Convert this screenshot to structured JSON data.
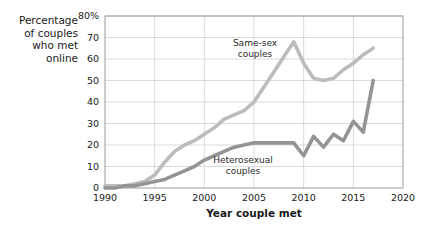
{
  "chart_data": {
    "type": "line",
    "title": "",
    "xlabel": "Year couple met",
    "ylabel": "Percentage of couples who met online",
    "ylabel_lines": [
      "Percentage",
      "of couples",
      "who met",
      "online"
    ],
    "xlim": [
      1990,
      2020
    ],
    "ylim": [
      0,
      80
    ],
    "grid": true,
    "legend_position": "inline-annotations",
    "x_ticks": [
      "1990",
      "1995",
      "2000",
      "2005",
      "2010",
      "2015",
      "2020"
    ],
    "x_tick_values": [
      1990,
      1995,
      2000,
      2005,
      2010,
      2015,
      2020
    ],
    "y_ticks": [
      "0",
      "10",
      "20",
      "30",
      "40",
      "50",
      "60",
      "70",
      "80%"
    ],
    "y_tick_values": [
      0,
      10,
      20,
      30,
      40,
      50,
      60,
      70,
      80
    ],
    "series": [
      {
        "name": "Same-sex couples",
        "color": "#bcbcbc",
        "label_lines": [
          "Same-sex",
          "couples"
        ],
        "x": [
          1990,
          1991,
          1992,
          1993,
          1994,
          1995,
          1996,
          1997,
          1998,
          1999,
          2000,
          2001,
          2002,
          2003,
          2004,
          2005,
          2006,
          2007,
          2008,
          2009,
          2010,
          2011,
          2012,
          2013,
          2014,
          2015,
          2016,
          2017
        ],
        "values": [
          1,
          1,
          1,
          2,
          3,
          6,
          12,
          17,
          20,
          22,
          25,
          28,
          32,
          34,
          36,
          40,
          47,
          54,
          61,
          68,
          58,
          51,
          50,
          51,
          55,
          58,
          62,
          65
        ]
      },
      {
        "name": "Heterosexual couples",
        "color": "#949494",
        "label_lines": [
          "Heterosexual",
          "couples"
        ],
        "x": [
          1990,
          1991,
          1992,
          1993,
          1994,
          1995,
          1996,
          1997,
          1998,
          1999,
          2000,
          2001,
          2002,
          2003,
          2004,
          2005,
          2006,
          2007,
          2008,
          2009,
          2010,
          2011,
          2012,
          2013,
          2014,
          2015,
          2016,
          2017
        ],
        "values": [
          0,
          0,
          1,
          1,
          2,
          3,
          4,
          6,
          8,
          10,
          13,
          15,
          17,
          19,
          20,
          21,
          21,
          21,
          21,
          21,
          15,
          24,
          19,
          25,
          22,
          31,
          26,
          50
        ]
      }
    ]
  },
  "axis_styles": {
    "grid_color": "#d2d2d2",
    "frame_color": "#9a9a9a"
  }
}
